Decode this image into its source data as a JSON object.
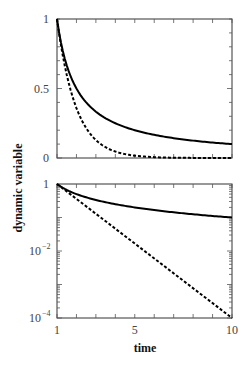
{
  "chart_data": [
    {
      "type": "line",
      "panel": "top",
      "scale": "linear",
      "xlabel": "",
      "ylabel": "dynamic variable",
      "xlim": [
        1,
        10
      ],
      "ylim": [
        0,
        1
      ],
      "yticks": [
        {
          "value": 0,
          "label": "0"
        },
        {
          "value": 0.5,
          "label": "0.5"
        },
        {
          "value": 1,
          "label": "1"
        }
      ],
      "xticks": [],
      "series": [
        {
          "name": "solid",
          "style": "solid",
          "x": [
            1,
            1.25,
            1.5,
            1.75,
            2,
            2.5,
            3,
            3.5,
            4,
            5,
            6,
            7,
            8,
            9,
            10
          ],
          "values": [
            1,
            0.8,
            0.667,
            0.571,
            0.5,
            0.4,
            0.333,
            0.286,
            0.25,
            0.2,
            0.167,
            0.143,
            0.125,
            0.111,
            0.1
          ]
        },
        {
          "name": "dashed",
          "style": "dashed",
          "x": [
            1,
            1.25,
            1.5,
            1.75,
            2,
            2.5,
            3,
            3.5,
            4,
            5,
            6,
            7,
            8,
            9,
            10
          ],
          "values": [
            1,
            0.774,
            0.599,
            0.464,
            0.359,
            0.215,
            0.129,
            0.077,
            0.046,
            0.0167,
            0.006,
            0.0022,
            0.0008,
            0.0003,
            0.0001
          ]
        }
      ]
    },
    {
      "type": "line",
      "panel": "bottom",
      "scale": "log",
      "xlabel": "time",
      "ylabel": "dynamic variable",
      "xlim": [
        1,
        10
      ],
      "ylim": [
        0.0001,
        1
      ],
      "yticks": [
        {
          "value": 1,
          "label": "1",
          "sup": ""
        },
        {
          "value": 0.01,
          "label": "10",
          "sup": "−2"
        },
        {
          "value": 0.0001,
          "label": "10",
          "sup": "−4"
        }
      ],
      "xticks": [
        {
          "value": 1,
          "label": "1"
        },
        {
          "value": 5,
          "label": "5"
        },
        {
          "value": 10,
          "label": "10"
        }
      ],
      "series": [
        {
          "name": "solid",
          "style": "solid",
          "x": [
            1,
            1.5,
            2,
            3,
            4,
            5,
            6,
            7,
            8,
            9,
            10
          ],
          "values": [
            1,
            0.667,
            0.5,
            0.333,
            0.25,
            0.2,
            0.167,
            0.143,
            0.125,
            0.111,
            0.1
          ]
        },
        {
          "name": "dashed",
          "style": "dashed",
          "x": [
            1,
            10
          ],
          "values": [
            1,
            0.0001
          ]
        }
      ]
    }
  ]
}
